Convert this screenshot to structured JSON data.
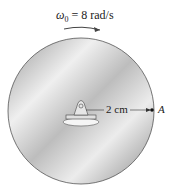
{
  "angular_velocity": {
    "symbol": "ω",
    "subscript": "0",
    "text": "= 8 rad/s"
  },
  "dimension": {
    "label": "2 cm"
  },
  "point": {
    "label": "A"
  },
  "colors": {
    "disk_light": "#f2f2f2",
    "disk_dark": "#8a8a8a",
    "stroke": "#333333"
  }
}
